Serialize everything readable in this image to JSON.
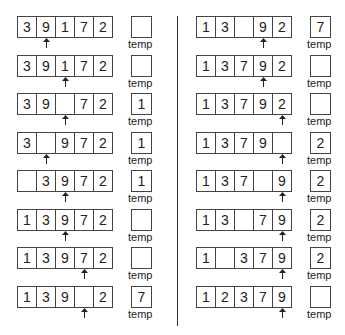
{
  "temp_label": "temp",
  "steps": [
    {
      "cells": [
        "3",
        "9",
        "1",
        "7",
        "2"
      ],
      "pointer": 1,
      "temp": ""
    },
    {
      "cells": [
        "3",
        "9",
        "1",
        "7",
        "2"
      ],
      "pointer": 2,
      "temp": ""
    },
    {
      "cells": [
        "3",
        "9",
        "",
        "7",
        "2"
      ],
      "pointer": 2,
      "temp": "1"
    },
    {
      "cells": [
        "3",
        "",
        "9",
        "7",
        "2"
      ],
      "pointer": 1,
      "temp": "1"
    },
    {
      "cells": [
        "",
        "3",
        "9",
        "7",
        "2"
      ],
      "pointer": 2,
      "temp": "1"
    },
    {
      "cells": [
        "1",
        "3",
        "9",
        "7",
        "2"
      ],
      "pointer": 2,
      "temp": ""
    },
    {
      "cells": [
        "1",
        "3",
        "9",
        "7",
        "2"
      ],
      "pointer": 3,
      "temp": ""
    },
    {
      "cells": [
        "1",
        "3",
        "9",
        "",
        "2"
      ],
      "pointer": 3,
      "temp": "7"
    },
    {
      "cells": [
        "1",
        "3",
        "",
        "9",
        "2"
      ],
      "pointer": 3,
      "temp": "7"
    },
    {
      "cells": [
        "1",
        "3",
        "7",
        "9",
        "2"
      ],
      "pointer": 3,
      "temp": ""
    },
    {
      "cells": [
        "1",
        "3",
        "7",
        "9",
        "2"
      ],
      "pointer": 4,
      "temp": ""
    },
    {
      "cells": [
        "1",
        "3",
        "7",
        "9",
        ""
      ],
      "pointer": 4,
      "temp": "2"
    },
    {
      "cells": [
        "1",
        "3",
        "7",
        "",
        "9"
      ],
      "pointer": 4,
      "temp": "2"
    },
    {
      "cells": [
        "1",
        "3",
        "",
        "7",
        "9"
      ],
      "pointer": 4,
      "temp": "2"
    },
    {
      "cells": [
        "1",
        "",
        "3",
        "7",
        "9"
      ],
      "pointer": 4,
      "temp": "2"
    },
    {
      "cells": [
        "1",
        "2",
        "3",
        "7",
        "9"
      ],
      "pointer": 4,
      "temp": ""
    }
  ]
}
